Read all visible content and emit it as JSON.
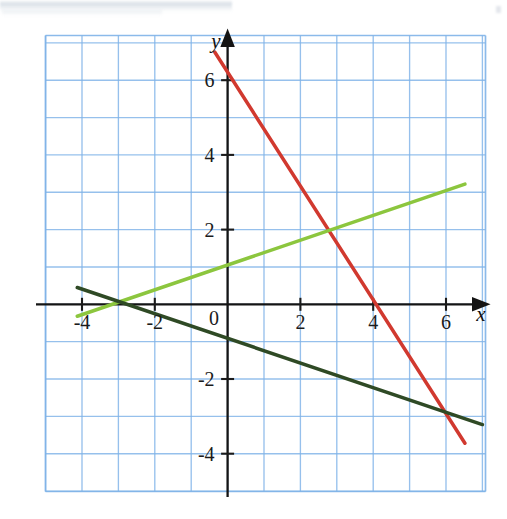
{
  "figure": {
    "title": "",
    "background_color": "#ffffff",
    "grid_color": "#7fb3e8",
    "axis_color": "#1b1b1b"
  },
  "axes": {
    "x_axis_label": "x",
    "y_axis_label": "y",
    "origin_label": "0",
    "x_ticks": [
      "-4",
      "-2",
      "2",
      "4",
      "6"
    ],
    "y_ticks": [
      "6",
      "4",
      "2",
      "-2",
      "-4"
    ],
    "x_tick_values": [
      -4,
      -2,
      2,
      4,
      6
    ],
    "y_tick_values": [
      6,
      4,
      2,
      -2,
      -4
    ]
  },
  "chart_data": {
    "type": "line",
    "title": "",
    "xlabel": "x",
    "ylabel": "y",
    "xlim": [
      -5.05,
      7.1
    ],
    "ylim": [
      -5.05,
      7.25
    ],
    "grid": true,
    "grid_step": 1,
    "legend": "none",
    "x_ticks": [
      -4,
      -2,
      2,
      4,
      6
    ],
    "y_ticks": [
      6,
      4,
      2,
      -2,
      -4
    ],
    "series": [
      {
        "name": "red-line",
        "color": "#d1392f",
        "slope": -1.55,
        "intercept": 6.2,
        "equation": "y = -1.55x + 6.2",
        "x_intercept": 4,
        "points": [
          {
            "x": -0.35,
            "y": 6.75
          },
          {
            "x": 0,
            "y": 6.2
          },
          {
            "x": 4,
            "y": 0
          },
          {
            "x": 6.52,
            "y": -3.72
          }
        ]
      },
      {
        "name": "light-green-line",
        "color": "#8cc63e",
        "slope": 0.333,
        "intercept": 1.05,
        "equation": "y = x/3 + 1",
        "x_intercept": -3.1,
        "points": [
          {
            "x": -4.13,
            "y": -0.32
          },
          {
            "x": -3.1,
            "y": 0
          },
          {
            "x": 0,
            "y": 1.05
          },
          {
            "x": 6.52,
            "y": 3.22
          }
        ]
      },
      {
        "name": "dark-green-line",
        "color": "#2f4a25",
        "slope": -0.333,
        "intercept": -0.9,
        "equation": "y = -x/3 - 0.9",
        "x_intercept": -2.7,
        "points": [
          {
            "x": -4.13,
            "y": 0.45
          },
          {
            "x": -2.7,
            "y": 0
          },
          {
            "x": 0,
            "y": -0.9
          },
          {
            "x": 7.0,
            "y": -3.22
          }
        ]
      }
    ],
    "intersections": [
      {
        "label": "light-green × dark-green",
        "x": -2.93,
        "y": 0.07
      },
      {
        "label": "red × light-green",
        "x": 2.73,
        "y": 1.96
      },
      {
        "label": "red × dark-green",
        "x": 5.81,
        "y": -2.84
      }
    ]
  }
}
